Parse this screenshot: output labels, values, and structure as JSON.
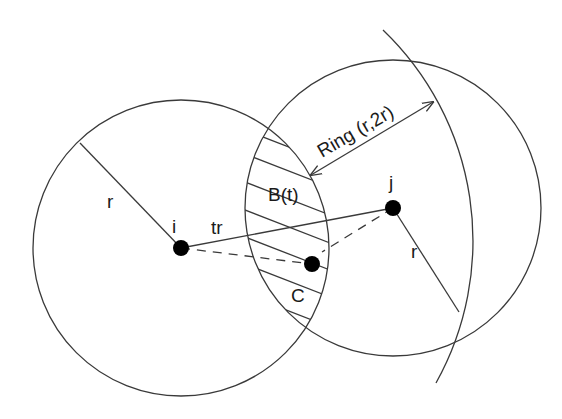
{
  "diagram": {
    "labels": {
      "node_i": "i",
      "node_j": "j",
      "radius_i": "r",
      "radius_j": "r",
      "distance_ij": "tr",
      "intersection_region": "B(t)",
      "subregion": "C",
      "ring": "Ring (r,2r)"
    },
    "nodes": [
      {
        "id": "i",
        "x": 181,
        "y": 248
      },
      {
        "id": "j",
        "x": 393,
        "y": 208
      },
      {
        "id": "relay",
        "x": 312,
        "y": 264
      }
    ],
    "circles": [
      {
        "id": "range-i",
        "cx": 181,
        "cy": 248,
        "r": 148
      },
      {
        "id": "range-j",
        "cx": 393,
        "cy": 208,
        "r": 148
      },
      {
        "id": "ring-outer-arc",
        "cx": 181,
        "cy": 248,
        "r": 292
      }
    ],
    "colors": {
      "line": "#3a3a3a",
      "node": "#000000",
      "background": "#ffffff"
    }
  }
}
